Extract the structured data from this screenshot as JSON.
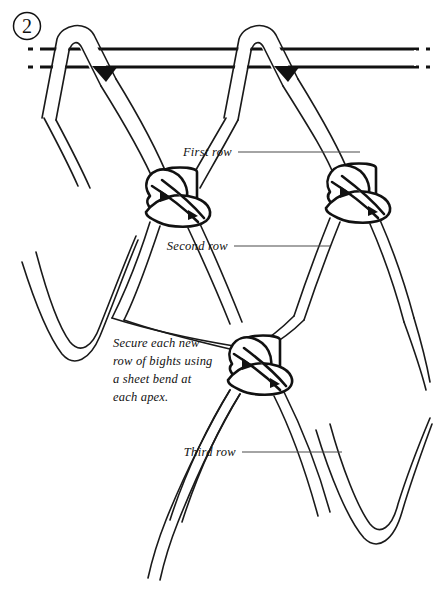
{
  "figure": {
    "step_number": "2",
    "width": 433,
    "height": 595,
    "background_color": "#ffffff",
    "ink_color": "#111111"
  },
  "callouts": [
    {
      "id": "first",
      "label": "First row",
      "x": 232,
      "y": 152,
      "leader_to_x": 360,
      "leader_y": 152
    },
    {
      "id": "second",
      "label": "Second row",
      "x": 228,
      "y": 246,
      "leader_to_x": 330,
      "leader_y": 246
    },
    {
      "id": "third",
      "label": "Third row",
      "x": 236,
      "y": 452,
      "leader_to_x": 342,
      "leader_y": 452
    }
  ],
  "caption": {
    "lines": [
      "Secure each new",
      "row of bights using",
      "a sheet bend at",
      "each apex."
    ],
    "x": 113,
    "y": 347,
    "line_height": 18
  },
  "bar": {
    "description": "horizontal support rope",
    "top_y": 48,
    "bottom_y": 66,
    "dash_left_end_x": 30,
    "dash_right_start_x": 400
  },
  "knots": [
    {
      "id": "knot-row1-left",
      "type": "sheet-bend",
      "cx": 180,
      "cy": 205
    },
    {
      "id": "knot-row1-right",
      "type": "sheet-bend",
      "cx": 358,
      "cy": 197
    },
    {
      "id": "knot-row2-mid",
      "type": "sheet-bend",
      "cx": 262,
      "cy": 372
    }
  ],
  "bights": [
    {
      "id": "bight-left",
      "apex_x": 62,
      "apex_y": 345
    },
    {
      "id": "bight-mid",
      "apex_x": 262,
      "apex_y": 372
    },
    {
      "id": "bight-right",
      "apex_x": 370,
      "apex_y": 540
    }
  ]
}
